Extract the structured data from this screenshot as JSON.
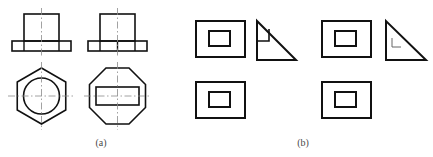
{
  "figure": {
    "background_color": "#ffffff",
    "line_color": "#111111",
    "thin_line_color": "#555555",
    "center_line_color": "#777777",
    "caption_color": "#4a4a4a",
    "width": 433,
    "height": 157,
    "captions": [
      {
        "label": "(a)",
        "x": 101,
        "y": 145
      },
      {
        "label": "(b)",
        "x": 303,
        "y": 145
      }
    ],
    "panels": [
      {
        "id": "panel-a",
        "label": "(a)",
        "description": "Two orthographic view pairs: front elevation over plan view",
        "items": [
          {
            "id": "a-1",
            "name": "hex-head-fastener-views",
            "front_view": {
              "name": "front-view-stepped-block",
              "shape": "stepped-block-with-flange",
              "body": {
                "x": 24,
                "y": 14,
                "width": 35,
                "height": 27
              },
              "flange": {
                "x": 12,
                "y": 41,
                "width": 59,
                "height": 10
              },
              "flange_divisions": [
                24,
                59
              ],
              "center_line_x": 41.5
            },
            "top_view": {
              "name": "top-view-hexagon-with-circle",
              "shape": "hexagon-with-inscribed-circle",
              "hexagon_center": {
                "x": 41.5,
                "y": 96
              },
              "hexagon_radius": 28,
              "circle_center": {
                "x": 41.5,
                "y": 96
              },
              "circle_radius": 18,
              "center_lines": true
            }
          },
          {
            "id": "a-2",
            "name": "octagon-head-fastener-views",
            "front_view": {
              "name": "front-view-stepped-block",
              "shape": "stepped-block-with-flange",
              "body": {
                "x": 100,
                "y": 14,
                "width": 35,
                "height": 27
              },
              "flange": {
                "x": 88,
                "y": 41,
                "width": 59,
                "height": 10
              },
              "flange_divisions": [
                100,
                117,
                135
              ],
              "center_line_x": 117.5
            },
            "top_view": {
              "name": "top-view-octagon-with-rectangle",
              "shape": "octagon-with-inscribed-rectangle",
              "octagon_center": {
                "x": 117.5,
                "y": 96
              },
              "octagon_radius": 28,
              "rectangle": {
                "x": 96,
                "y": 87,
                "width": 43,
                "height": 18
              },
              "center_lines": true
            }
          }
        ]
      },
      {
        "id": "panel-b",
        "label": "(b)",
        "description": "Two view-sets each combining a rectangular view, a right-triangle view and a lower rectangular view",
        "items": [
          {
            "id": "b-1",
            "name": "view-set-left",
            "front_view": {
              "name": "front-view-rectangle-with-hole",
              "outer": {
                "x": 196,
                "y": 21,
                "width": 49,
                "height": 36
              },
              "inner": {
                "x": 209,
                "y": 31,
                "width": 21,
                "height": 15
              }
            },
            "side_view": {
              "name": "side-view-right-triangle-with-notch",
              "points": "257,21 257,60 296,60",
              "notch": {
                "x": 257,
                "y": 29,
                "width": 12,
                "height": 12
              },
              "notch_style": "solid-square-step"
            },
            "top_view": {
              "name": "top-view-rectangle-with-hole",
              "outer": {
                "x": 196,
                "y": 82,
                "width": 49,
                "height": 36
              },
              "inner": {
                "x": 209,
                "y": 92,
                "width": 21,
                "height": 15
              }
            }
          },
          {
            "id": "b-2",
            "name": "view-set-right",
            "front_view": {
              "name": "front-view-rectangle-with-hole",
              "outer": {
                "x": 322,
                "y": 21,
                "width": 49,
                "height": 36
              },
              "inner": {
                "x": 335,
                "y": 31,
                "width": 21,
                "height": 15
              }
            },
            "side_view": {
              "name": "side-view-right-triangle-with-corner-mark",
              "points": "386,21 386,60 426,60",
              "corner_mark": {
                "x": 392,
                "y": 38,
                "width": 9,
                "height": 9
              },
              "corner_mark_style": "thin-L-mark"
            },
            "top_view": {
              "name": "top-view-rectangle-with-hole",
              "outer": {
                "x": 322,
                "y": 82,
                "width": 49,
                "height": 36
              },
              "inner": {
                "x": 335,
                "y": 92,
                "width": 21,
                "height": 15
              }
            }
          }
        ]
      }
    ]
  }
}
